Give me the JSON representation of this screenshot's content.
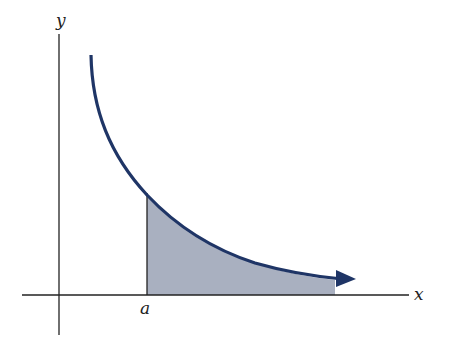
{
  "diagram": {
    "type": "area-under-curve",
    "labels": {
      "x_axis": "x",
      "y_axis": "y",
      "lower_bound": "a"
    },
    "colors": {
      "curve": "#1f3566",
      "shade": "#a9b0c0",
      "axes": "#222222"
    }
  }
}
